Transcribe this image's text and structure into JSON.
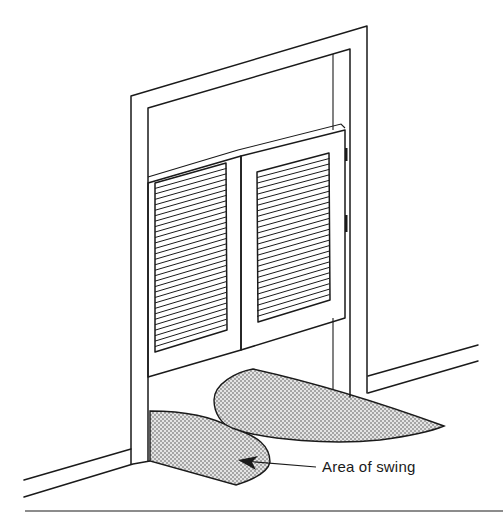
{
  "figure": {
    "callout_label": "Area of swing",
    "colors": {
      "line": "#1a1a1a",
      "background": "#ffffff",
      "stipple": "#555555"
    },
    "elements": [
      "door-frame",
      "left-louvered-door",
      "right-louvered-door",
      "hinges",
      "baseboards",
      "swing-area-inside",
      "swing-area-outside",
      "callout-arrow",
      "bottom-rule"
    ]
  }
}
